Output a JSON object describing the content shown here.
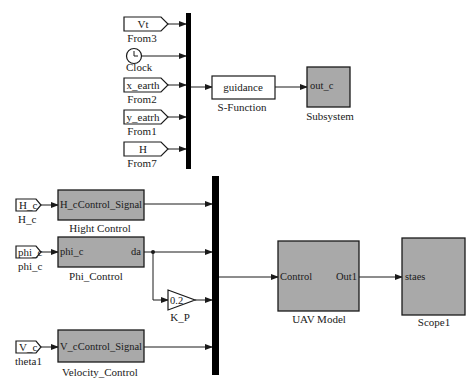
{
  "diagram": {
    "type": "simulink-model",
    "top_group": {
      "inputs": [
        {
          "id": "vt",
          "tag": "Vt",
          "caption": "From3",
          "kind": "from"
        },
        {
          "id": "clock",
          "tag": "",
          "caption": "Clock",
          "kind": "clock"
        },
        {
          "id": "x_earth",
          "tag": "x_earth",
          "caption": "From2",
          "kind": "from"
        },
        {
          "id": "y_eatrh",
          "tag": "y_eatrh",
          "caption": "From1",
          "kind": "from"
        },
        {
          "id": "h",
          "tag": "H",
          "caption": "From7",
          "kind": "from"
        }
      ],
      "sfunction": {
        "text": "guidance",
        "caption": "S-Function"
      },
      "subsystem": {
        "port": "out_c",
        "caption": "Subsystem"
      }
    },
    "bottom_group": {
      "hc_tag": {
        "tag": "H_c",
        "caption": "H_c"
      },
      "phic_tag": {
        "tag": "phi_c",
        "caption": "phi_c"
      },
      "vc_tag": {
        "tag": "V_c",
        "caption": "theta1"
      },
      "hight_control": {
        "in_port": "H_c",
        "out_port": "Control_Signal",
        "caption": "Hight Control"
      },
      "phi_control": {
        "in_port": "phi_c",
        "out_port": "da",
        "caption": "Phi_Control"
      },
      "gain": {
        "value": "0.2",
        "caption": "K_P"
      },
      "velocity_control": {
        "in_port": "V_c",
        "out_port": "Control_Signal",
        "caption": "Velocity_Control"
      },
      "uav_model": {
        "in_port": "Control",
        "out_port": "Out1",
        "caption": "UAV Model"
      },
      "scope": {
        "in_port": "staes",
        "caption": "Scope1"
      }
    },
    "colors": {
      "block_fill": "#a9a9a9",
      "line": "#1a1a1a",
      "mux": "#000000",
      "background": "#ffffff"
    }
  }
}
